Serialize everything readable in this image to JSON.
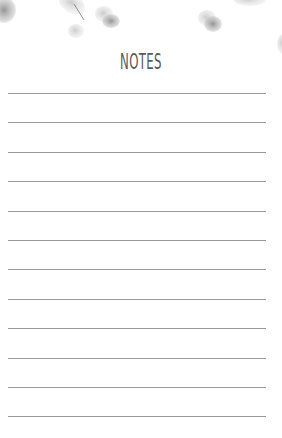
{
  "page": {
    "title": "NOTES",
    "line_count": 12,
    "line_color": "#9a9a9a",
    "title_color": "#5a5a5a",
    "decoration": "watercolor-eucalyptus-leaves"
  }
}
